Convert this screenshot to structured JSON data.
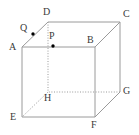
{
  "figure": {
    "type": "geometry-diagram",
    "shape": "cube",
    "canvas": {
      "width": 139,
      "height": 135
    },
    "background_color": "#ffffff",
    "edge_color": "#9a9a9a",
    "hidden_edge_color": "#9a9a9a",
    "point_color": "#000000",
    "label_color": "#3a3a3a"
  },
  "vertices": [
    {
      "name": "A",
      "label": "A",
      "x": 22,
      "y": 47,
      "label_x": 9,
      "label_y": 42,
      "hidden": false
    },
    {
      "name": "B",
      "label": "B",
      "x": 95,
      "y": 47,
      "label_x": 87,
      "label_y": 35,
      "hidden": false
    },
    {
      "name": "C",
      "label": "C",
      "x": 120,
      "y": 22,
      "label_x": 123,
      "label_y": 9,
      "hidden": false
    },
    {
      "name": "D",
      "label": "D",
      "x": 48,
      "y": 22,
      "label_x": 43,
      "label_y": 7,
      "hidden": false
    },
    {
      "name": "E",
      "label": "E",
      "x": 22,
      "y": 117,
      "label_x": 10,
      "label_y": 112,
      "hidden": false
    },
    {
      "name": "F",
      "label": "F",
      "x": 95,
      "y": 117,
      "label_x": 91,
      "label_y": 120,
      "hidden": false
    },
    {
      "name": "G",
      "label": "G",
      "x": 120,
      "y": 92,
      "label_x": 123,
      "label_y": 86,
      "hidden": false
    },
    {
      "name": "H",
      "label": "H",
      "x": 48,
      "y": 92,
      "label_x": 44,
      "label_y": 93,
      "hidden": true
    }
  ],
  "points": [
    {
      "name": "P",
      "label": "P",
      "x": 53,
      "y": 46,
      "label_x": 49,
      "label_y": 31,
      "on_segment": "AB",
      "radius": 1.7
    },
    {
      "name": "Q",
      "label": "Q",
      "x": 33,
      "y": 34,
      "label_x": 20,
      "label_y": 23,
      "on_segment": "AD",
      "radius": 1.7
    }
  ],
  "edges": [
    {
      "from": "A",
      "to": "B",
      "style": "solid",
      "name": "edge-AB"
    },
    {
      "from": "B",
      "to": "C",
      "style": "solid",
      "name": "edge-BC"
    },
    {
      "from": "C",
      "to": "D",
      "style": "solid",
      "name": "edge-CD"
    },
    {
      "from": "D",
      "to": "A",
      "style": "solid",
      "name": "edge-DA"
    },
    {
      "from": "A",
      "to": "E",
      "style": "solid",
      "name": "edge-AE"
    },
    {
      "from": "B",
      "to": "F",
      "style": "solid",
      "name": "edge-BF"
    },
    {
      "from": "C",
      "to": "G",
      "style": "solid",
      "name": "edge-CG"
    },
    {
      "from": "D",
      "to": "H",
      "style": "dotted",
      "name": "edge-DH"
    },
    {
      "from": "E",
      "to": "F",
      "style": "solid",
      "name": "edge-EF"
    },
    {
      "from": "F",
      "to": "G",
      "style": "solid",
      "name": "edge-FG"
    },
    {
      "from": "G",
      "to": "H",
      "style": "dotted",
      "name": "edge-GH"
    },
    {
      "from": "H",
      "to": "E",
      "style": "dotted",
      "name": "edge-HE"
    }
  ]
}
